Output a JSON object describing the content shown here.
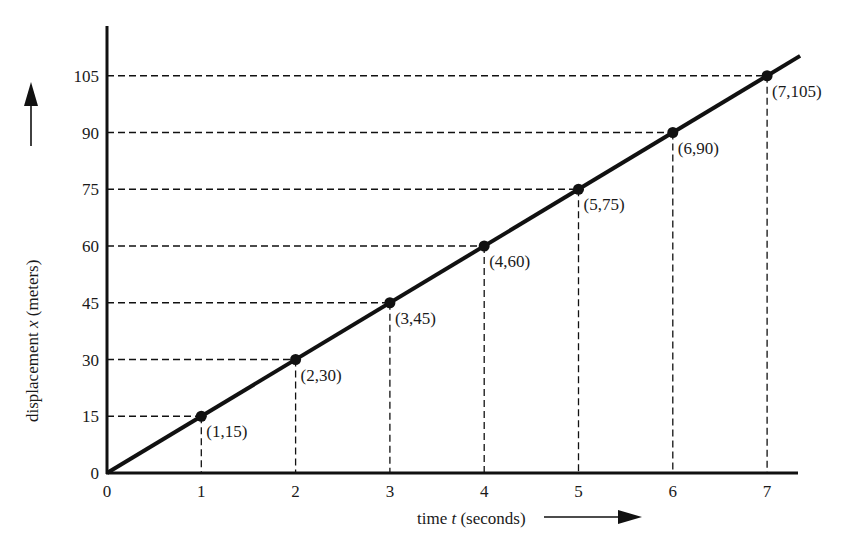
{
  "chart_data": {
    "type": "line",
    "title": "",
    "xlabel": "time t (seconds)",
    "ylabel": "displacement x (meters)",
    "xlabel_parts": {
      "pre": "time ",
      "var": "t",
      "post": " (seconds)"
    },
    "ylabel_parts": {
      "pre": "displacement ",
      "var": "x",
      "post": " (meters)"
    },
    "xlim": [
      0,
      7.3
    ],
    "ylim": [
      0,
      115
    ],
    "x_ticks": [
      0,
      1,
      2,
      3,
      4,
      5,
      6,
      7
    ],
    "y_ticks": [
      0,
      15,
      30,
      45,
      60,
      75,
      90,
      105
    ],
    "grid": false,
    "reference_lines": "dashed projections from each point to both axes",
    "legend": null,
    "series": [
      {
        "name": "displacement",
        "x": [
          0,
          1,
          2,
          3,
          4,
          5,
          6,
          7
        ],
        "y": [
          0,
          15,
          30,
          45,
          60,
          75,
          90,
          105
        ],
        "line_extends_to": [
          7.35,
          110.25
        ],
        "markers": true
      }
    ],
    "annotations": [
      {
        "x": 1,
        "y": 15,
        "text": "(1,15)"
      },
      {
        "x": 2,
        "y": 30,
        "text": "(2,30)"
      },
      {
        "x": 3,
        "y": 45,
        "text": "(3,45)"
      },
      {
        "x": 4,
        "y": 60,
        "text": "(4,60)"
      },
      {
        "x": 5,
        "y": 75,
        "text": "(5,75)"
      },
      {
        "x": 6,
        "y": 90,
        "text": "(6,90)"
      },
      {
        "x": 7,
        "y": 105,
        "text": "(7,105)"
      }
    ]
  },
  "colors": {
    "ink": "#111111",
    "background": "#ffffff"
  }
}
